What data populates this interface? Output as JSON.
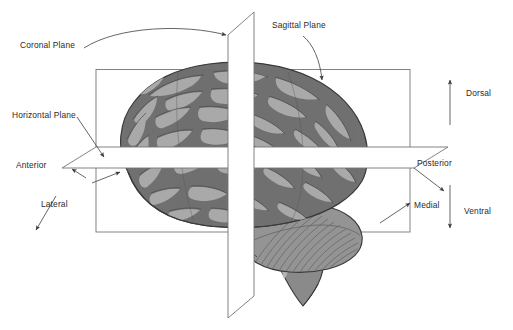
{
  "figure": {
    "background_color": "#ffffff",
    "line_color": "#6e6e6e",
    "text_color": "#2b2b2b"
  },
  "labels": {
    "coronal_plane": "Coronal Plane",
    "sagittal_plane": "Sagittal Plane",
    "horizontal_plane": "Horizontal Plane",
    "anterior": "Anterior",
    "posterior": "Posterior",
    "lateral": "Lateral",
    "medial": "Medial",
    "dorsal": "Dorsal",
    "ventral": "Ventral"
  },
  "planes": [
    {
      "name": "coronal-plane",
      "label": "Coronal Plane",
      "shape": "rectangle",
      "stroke": "#6e6e6e",
      "fill": "none"
    },
    {
      "name": "sagittal-plane",
      "label": "Sagittal Plane",
      "shape": "vertical-slab",
      "stroke": "#6e6e6e",
      "fill": "#ffffff"
    },
    {
      "name": "horizontal-plane",
      "label": "Horizontal Plane",
      "shape": "horizontal-slab",
      "stroke": "#6e6e6e",
      "fill": "#ffffff"
    }
  ],
  "direction_arrows": [
    {
      "name": "anterior-arrow",
      "label": "Anterior",
      "direction": "up-left"
    },
    {
      "name": "posterior-arrow",
      "label": "Posterior",
      "direction": "down-right"
    },
    {
      "name": "lateral-arrow",
      "label": "Lateral",
      "direction": "down-left"
    },
    {
      "name": "medial-arrow",
      "label": "Medial",
      "direction": "up-right"
    },
    {
      "name": "dorsal-arrow",
      "label": "Dorsal",
      "direction": "up"
    },
    {
      "name": "ventral-arrow",
      "label": "Ventral",
      "direction": "down"
    }
  ],
  "brain": {
    "name": "brain-illustration",
    "view": "lateral sagittal view, anterior to the left",
    "parts": [
      "cerebrum",
      "cerebellum",
      "brainstem"
    ],
    "colors": {
      "cortex_dark": "#6f6f6f",
      "gyri_light": "#a9a9a9",
      "cerebellum": "#8d8d8d",
      "brainstem": "#8a8a8a",
      "outline": "#3a3a3a"
    }
  }
}
